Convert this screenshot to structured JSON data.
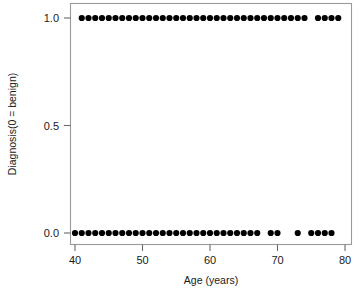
{
  "chart_data": {
    "type": "scatter",
    "title": "",
    "xlabel": "Age (years)",
    "ylabel": "Diagnosis(0 = benign)",
    "xlim": [
      38.5,
      80.5
    ],
    "ylim": [
      -0.08,
      1.08
    ],
    "xticks": [
      40,
      50,
      60,
      70,
      80
    ],
    "xticklabels": [
      "40",
      "50",
      "60",
      "70",
      "80"
    ],
    "yticks": [
      0.0,
      0.5,
      1.0
    ],
    "yticklabels": [
      "0.0",
      "0.5",
      "1.0"
    ],
    "grid": false,
    "legend": false,
    "marker": "filled-circle",
    "marker_color": "#000000",
    "marker_size": 3.1,
    "frame": "box",
    "series": [
      {
        "name": "Diagnosis vs Age",
        "x": [
          41,
          42,
          43,
          44,
          45,
          46,
          47,
          48,
          49,
          50,
          51,
          52,
          53,
          54,
          55,
          56,
          57,
          58,
          59,
          60,
          61,
          62,
          63,
          64,
          65,
          66,
          67,
          68,
          69,
          70,
          71,
          72,
          73,
          74,
          76,
          77,
          78,
          79,
          40,
          41,
          42,
          43,
          44,
          45,
          46,
          47,
          48,
          49,
          50,
          51,
          52,
          53,
          54,
          55,
          56,
          57,
          58,
          59,
          60,
          61,
          62,
          63,
          64,
          65,
          66,
          67,
          69,
          70,
          73,
          75,
          76,
          77,
          78
        ],
        "y": [
          1,
          1,
          1,
          1,
          1,
          1,
          1,
          1,
          1,
          1,
          1,
          1,
          1,
          1,
          1,
          1,
          1,
          1,
          1,
          1,
          1,
          1,
          1,
          1,
          1,
          1,
          1,
          1,
          1,
          1,
          1,
          1,
          1,
          1,
          1,
          1,
          1,
          1,
          0,
          0,
          0,
          0,
          0,
          0,
          0,
          0,
          0,
          0,
          0,
          0,
          0,
          0,
          0,
          0,
          0,
          0,
          0,
          0,
          0,
          0,
          0,
          0,
          0,
          0,
          0,
          0,
          0,
          0,
          0,
          0,
          0,
          0,
          0
        ]
      }
    ]
  },
  "axes": {
    "x_title": "Age (years)",
    "y_title": "Diagnosis(0 = benign)",
    "x_tick_labels": [
      "40",
      "50",
      "60",
      "70",
      "80"
    ],
    "y_tick_labels": [
      "0.0",
      "0.5",
      "1.0"
    ]
  },
  "colors": {
    "marker": "#000000",
    "frame": "#9a9a9a",
    "tick": "#6b6b6b",
    "text": "#1a1a1a",
    "background": "#ffffff"
  }
}
